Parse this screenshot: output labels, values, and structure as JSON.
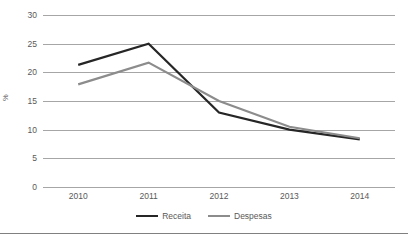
{
  "chart_data": {
    "type": "line",
    "title": "",
    "xlabel": "",
    "ylabel": "%",
    "categories": [
      "2010",
      "2011",
      "2012",
      "2013",
      "2014"
    ],
    "ylim": [
      0,
      30
    ],
    "yticks": [
      0,
      5,
      10,
      15,
      20,
      25,
      30
    ],
    "ytick_labels": [
      "0",
      "5",
      "10",
      "15",
      "20",
      "25",
      "30"
    ],
    "grid": "horizontal",
    "legend_position": "bottom",
    "series": [
      {
        "name": "Receita",
        "color": "#262626",
        "values": [
          21.3,
          25.0,
          13.0,
          10.0,
          8.3
        ]
      },
      {
        "name": "Despesas",
        "color": "#8c8c8c",
        "values": [
          17.9,
          21.7,
          15.0,
          10.5,
          8.5
        ]
      }
    ]
  },
  "colors": {
    "gridline": "#a6a6a6",
    "text": "#595959",
    "rule": "#808080",
    "background": "#ffffff"
  }
}
